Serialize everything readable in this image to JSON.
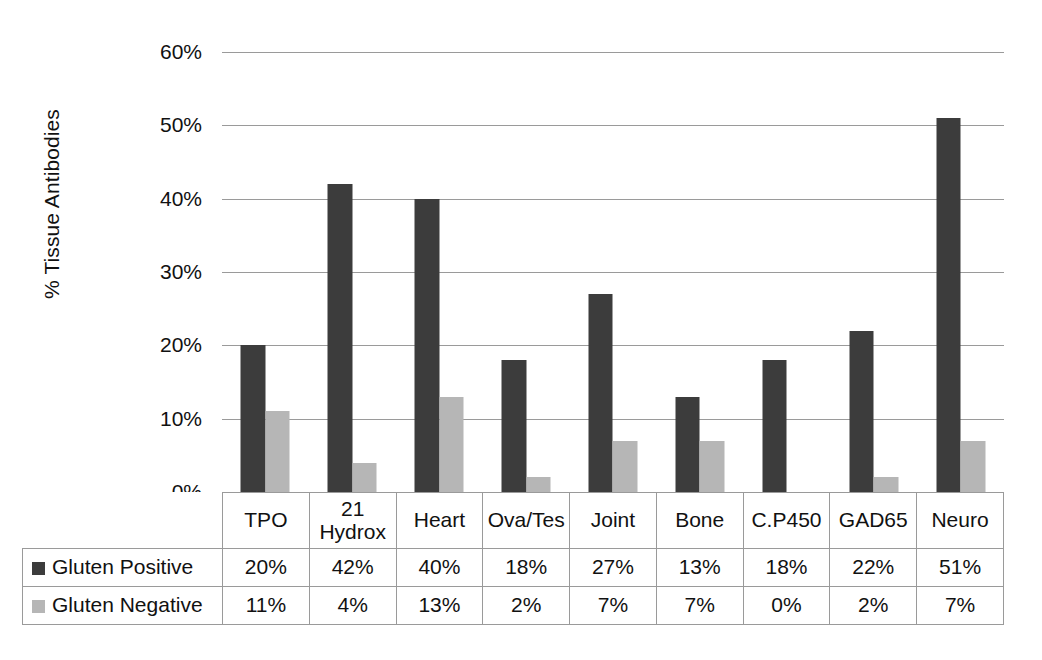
{
  "chart_data": {
    "type": "bar",
    "title": "",
    "subtitle": "",
    "xlabel": "",
    "ylabel": "% Tissue Antibodies",
    "categories": [
      "TPO",
      "21 Hydrox",
      "Heart",
      "Ova/Tes",
      "Joint",
      "Bone",
      "C.P450",
      "GAD65",
      "Neuro"
    ],
    "category_lines": [
      [
        "TPO"
      ],
      [
        "21",
        "Hydrox"
      ],
      [
        "Heart"
      ],
      [
        "Ova/Tes"
      ],
      [
        "Joint"
      ],
      [
        "Bone"
      ],
      [
        "C.P450"
      ],
      [
        "GAD65"
      ],
      [
        "Neuro"
      ]
    ],
    "series": [
      {
        "name": "Gluten Positive",
        "color": "#3c3c3c",
        "values": [
          20,
          42,
          40,
          18,
          27,
          13,
          18,
          22,
          51
        ],
        "labels": [
          "20%",
          "42%",
          "40%",
          "18%",
          "27%",
          "13%",
          "18%",
          "22%",
          "51%"
        ]
      },
      {
        "name": "Gluten Negative",
        "color": "#b6b6b6",
        "values": [
          11,
          4,
          13,
          2,
          7,
          7,
          0,
          2,
          7
        ],
        "labels": [
          "11%",
          "4%",
          "13%",
          "2%",
          "7%",
          "7%",
          "0%",
          "2%",
          "7%"
        ]
      }
    ],
    "ylim": [
      0,
      60
    ],
    "yticks": [
      0,
      10,
      20,
      30,
      40,
      50,
      60
    ],
    "ytick_labels": [
      "0%",
      "10%",
      "20%",
      "30%",
      "40%",
      "50%",
      "60%"
    ],
    "grid": true,
    "legend_position": "data-table-row-headers"
  },
  "table": {
    "row_headers": [
      "Gluten Positive",
      "Gluten Negative"
    ],
    "rows": [
      [
        "20%",
        "42%",
        "40%",
        "18%",
        "27%",
        "13%",
        "18%",
        "22%",
        "51%"
      ],
      [
        "11%",
        "4%",
        "13%",
        "2%",
        "7%",
        "7%",
        "0%",
        "2%",
        "7%"
      ]
    ]
  }
}
